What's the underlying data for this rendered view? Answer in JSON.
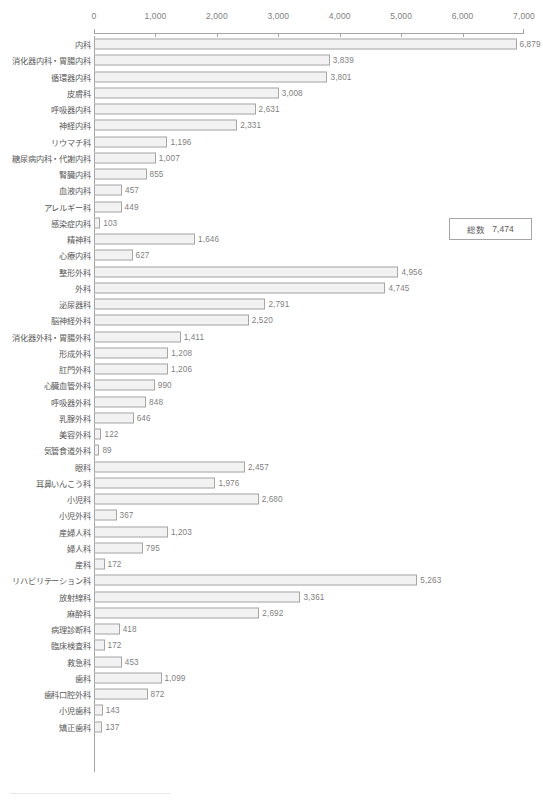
{
  "chart_data": {
    "type": "bar",
    "orientation": "horizontal",
    "title": "",
    "xlabel": "",
    "ylabel": "",
    "xlim": [
      0,
      7000
    ],
    "xticks": [
      "0",
      "1,000",
      "2,000",
      "3,000",
      "4,000",
      "5,000",
      "6,000",
      "7,000"
    ],
    "xtick_values": [
      0,
      1000,
      2000,
      3000,
      4000,
      5000,
      6000,
      7000
    ],
    "grid": false,
    "legend": null,
    "categories": [
      "内科",
      "消化器内科・胃腸内科",
      "循環器内科",
      "皮膚科",
      "呼吸器内科",
      "神経内科",
      "リウマチ科",
      "糖尿病内科・代謝内科",
      "腎臓内科",
      "血液内科",
      "アレルギー科",
      "感染症内科",
      "精神科",
      "心療内科",
      "整形外科",
      "外科",
      "泌尿器科",
      "脳神経外科",
      "消化器外科・胃腸外科",
      "形成外科",
      "肛門外科",
      "心臓血管外科",
      "呼吸器外科",
      "乳腺外科",
      "美容外科",
      "気管食道外科",
      "眼科",
      "耳鼻いんこう科",
      "小児科",
      "小児外科",
      "産婦人科",
      "婦人科",
      "産科",
      "リハビリテーション科",
      "放射線科",
      "麻酔科",
      "病理診断科",
      "臨床検査科",
      "救急科",
      "歯科",
      "歯科口腔外科",
      "小児歯科",
      "矯正歯科"
    ],
    "values": [
      6879,
      3839,
      3801,
      3008,
      2631,
      2331,
      1196,
      1007,
      855,
      457,
      449,
      103,
      1646,
      627,
      4956,
      4745,
      2791,
      2520,
      1411,
      1208,
      1206,
      990,
      848,
      646,
      122,
      89,
      2457,
      1976,
      2680,
      367,
      1203,
      795,
      172,
      5263,
      3361,
      2692,
      418,
      172,
      453,
      1099,
      872,
      143,
      137
    ],
    "value_labels": [
      "6,879",
      "3,839",
      "3,801",
      "3,008",
      "2,631",
      "2,331",
      "1,196",
      "1,007",
      "855",
      "457",
      "449",
      "103",
      "1,646",
      "627",
      "4,956",
      "4,745",
      "2,791",
      "2,520",
      "1,411",
      "1,208",
      "1,206",
      "990",
      "848",
      "646",
      "122",
      "89",
      "2,457",
      "1,976",
      "2,680",
      "367",
      "1,203",
      "795",
      "172",
      "5,263",
      "3,361",
      "2,692",
      "418",
      "172",
      "453",
      "1,099",
      "872",
      "143",
      "137"
    ]
  },
  "annotations": {
    "total": {
      "label": "総数",
      "value": "7,474"
    }
  },
  "colors": {
    "bar_fill": "#f2f2f2",
    "bar_stroke": "#a6a6a6",
    "axis": "#a6a6a6",
    "label_text": "#595959",
    "value_text": "#7f7f7f",
    "background": "#ffffff"
  }
}
